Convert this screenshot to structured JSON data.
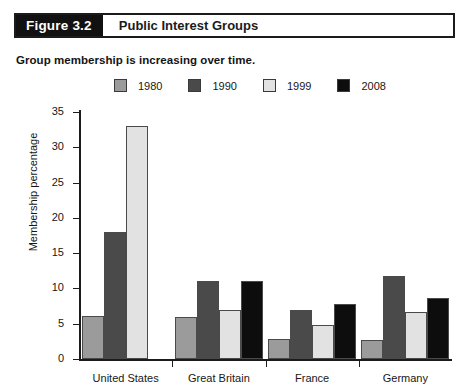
{
  "figure": {
    "number": "Figure 3.2",
    "title": "Public Interest Groups"
  },
  "subtitle": "Group membership is increasing over time.",
  "chart_data": {
    "type": "bar",
    "title": "Public Interest Groups",
    "subtitle": "Group membership is increasing over time.",
    "xlabel": "",
    "ylabel": "Membership percentage",
    "ylim": [
      0,
      35
    ],
    "yticks": [
      0,
      5,
      10,
      15,
      20,
      25,
      30,
      35
    ],
    "ytick_labels": [
      "0",
      "5",
      "10",
      "15",
      "20",
      "25",
      "30",
      "35"
    ],
    "grid": false,
    "legend_position": "top",
    "categories": [
      "United States",
      "Great Britain",
      "France",
      "Germany"
    ],
    "series": [
      {
        "name": "1980",
        "color": "#9b9b9b",
        "values": [
          6.1,
          6.0,
          2.8,
          2.7
        ]
      },
      {
        "name": "1990",
        "color": "#4a4a4a",
        "values": [
          18.0,
          11.0,
          6.9,
          11.7
        ]
      },
      {
        "name": "1999",
        "color": "#e2e2e2",
        "values": [
          33.0,
          7.0,
          4.8,
          6.7
        ]
      },
      {
        "name": "2008",
        "color": "#0d0d0d",
        "values": [
          null,
          11.0,
          7.8,
          8.7
        ]
      }
    ]
  }
}
